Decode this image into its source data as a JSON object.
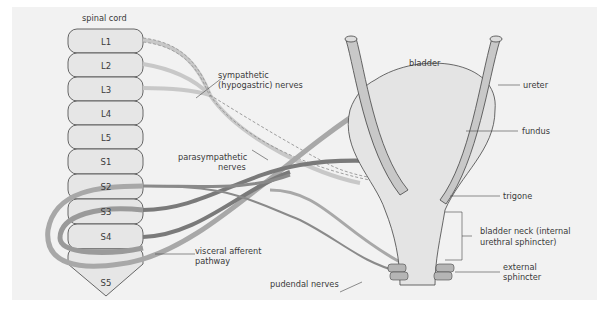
{
  "diagram": {
    "title_label": "spinal cord",
    "segments": [
      "L1",
      "L2",
      "L3",
      "L4",
      "L5",
      "S1",
      "S2",
      "S3",
      "S4",
      "S5"
    ],
    "labels": {
      "sympathetic": [
        "sympathetic",
        "(hypogastric) nerves"
      ],
      "parasympathetic": [
        "parasympathetic",
        "nerves"
      ],
      "visceral": [
        "visceral afferent",
        "pathway"
      ],
      "pudendal": "pudendal nerves",
      "bladder": "bladder",
      "ureter": "ureter",
      "fundus": "fundus",
      "trigone": "trigone",
      "bladder_neck": [
        "bladder neck (internal",
        "urethral sphincter)"
      ],
      "external": [
        "external",
        "sphincter"
      ]
    },
    "colors": {
      "background": "#f2f2f2",
      "segment_fill": "#e6e6e6",
      "outline": "#444444",
      "nerve_dark": "#7a7a7a",
      "nerve_mid": "#9a9a9a",
      "nerve_light": "#b5b5b5",
      "bladder_fill": "#e4e4e4",
      "ureter_fill": "#c8c8c8"
    }
  }
}
